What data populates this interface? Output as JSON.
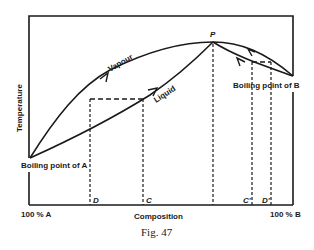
{
  "figure": {
    "caption": "Fig. 47",
    "x_axis_label": "Composition",
    "y_axis_label": "Temperature",
    "x_left_label": "100 % A",
    "x_right_label": "100 % B",
    "curve_labels": {
      "vapour": "Vapour",
      "liquid": "Liquid"
    },
    "point_labels": {
      "boiling_a": "Boiling point of A",
      "boiling_b": "Boiling point of B",
      "peak": "P",
      "d": "D",
      "c": "C",
      "c_prime": "C'",
      "d_prime": "D'"
    },
    "colors": {
      "ink": "#1a1a1a",
      "background": "#ffffff"
    }
  }
}
